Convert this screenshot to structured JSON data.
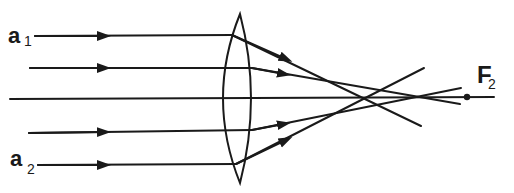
{
  "diagram": {
    "labels": {
      "a1_main": "a",
      "a1_sub": "1",
      "a2_main": "a",
      "a2_sub": "2",
      "focus_main": "F",
      "focus_sub": "2"
    },
    "colors": {
      "stroke": "#1a1a1a",
      "background": "#ffffff"
    },
    "elements": {
      "lens": "biconvex converging lens",
      "optical_axis": "horizontal principal axis",
      "rays": [
        {
          "id": "ray-1",
          "label": "a1",
          "position": "marginal top"
        },
        {
          "id": "ray-2",
          "position": "paraxial top"
        },
        {
          "id": "ray-3",
          "position": "axial"
        },
        {
          "id": "ray-4",
          "position": "paraxial bottom"
        },
        {
          "id": "ray-5",
          "label": "a2",
          "position": "marginal bottom"
        }
      ],
      "focal_point": "F2"
    }
  }
}
